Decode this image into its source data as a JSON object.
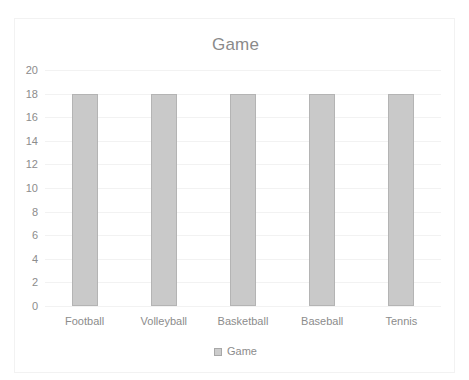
{
  "chart_data": {
    "type": "bar",
    "title": "Game",
    "categories": [
      "Football",
      "Volleyball",
      "Basketball",
      "Baseball",
      "Tennis"
    ],
    "values": [
      18,
      18,
      18,
      18,
      18
    ],
    "series": [
      {
        "name": "Game",
        "values": [
          18,
          18,
          18,
          18,
          18
        ]
      }
    ],
    "xlabel": "",
    "ylabel": "",
    "ylim": [
      0,
      20
    ],
    "ytick_labels": [
      "20",
      "18",
      "16",
      "14",
      "12",
      "10",
      "8",
      "6",
      "4",
      "2",
      "0"
    ],
    "ytick_values": [
      20,
      18,
      16,
      14,
      12,
      10,
      8,
      6,
      4,
      2,
      0
    ],
    "grid": true,
    "legend": {
      "position": "bottom",
      "entries": [
        "Game"
      ]
    },
    "colors": {
      "bar_fill": "#c9c9c9",
      "bar_border": "#b4b4b4",
      "gridline": "#f2f2f2",
      "text": "#8c8c8c",
      "title_text": "#8a8a8a",
      "plot_background": "#ffffff",
      "frame_border": "#f2f2f2"
    }
  }
}
